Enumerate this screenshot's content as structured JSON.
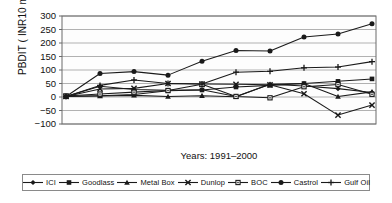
{
  "chart_data": {
    "type": "line",
    "title": "",
    "xlabel": "Years: 1991–2000",
    "ylabel": "PBDIT ( INR10 million)",
    "x": [
      1991,
      1992,
      1993,
      1994,
      1995,
      1996,
      1997,
      1998,
      1999,
      2000
    ],
    "categories": [
      "1991",
      "1992",
      "1993",
      "1994",
      "1995",
      "1996",
      "1997",
      "1998",
      "1999",
      "2000"
    ],
    "ylim": [
      -100,
      300
    ],
    "yticks": [
      -100,
      -50,
      0,
      50,
      100,
      150,
      200,
      250,
      300
    ],
    "ytick_labels": [
      "−100",
      "−50",
      "0",
      "50",
      "100",
      "150",
      "200",
      "250",
      "300"
    ],
    "grid": true,
    "grid_axis": "y",
    "legend_position": "bottom",
    "series": [
      {
        "name": "ICI",
        "marker": "diamond",
        "color": "#1a1a1a",
        "values": [
          2,
          40,
          28,
          25,
          27,
          2,
          47,
          41,
          31,
          17
        ]
      },
      {
        "name": "Goodlass",
        "marker": "square",
        "color": "#1a1a1a",
        "values": [
          3,
          5,
          9,
          23,
          26,
          37,
          43,
          50,
          58,
          67
        ]
      },
      {
        "name": "Metal Box",
        "marker": "triangle",
        "color": "#1a1a1a",
        "values": [
          2,
          4,
          6,
          2,
          5,
          1,
          47,
          50,
          2,
          19
        ]
      },
      {
        "name": "Dunlop",
        "marker": "x",
        "color": "#1a1a1a",
        "values": [
          2,
          30,
          32,
          50,
          48,
          47,
          45,
          12,
          -67,
          -30
        ]
      },
      {
        "name": "BOC",
        "marker": "small-square",
        "color": "#1a1a1a",
        "values": [
          4,
          11,
          18,
          24,
          47,
          2,
          -3,
          38,
          46,
          10
        ]
      },
      {
        "name": "Castrol",
        "marker": "circle",
        "color": "#1a1a1a",
        "values": [
          2,
          87,
          94,
          81,
          132,
          172,
          170,
          222,
          233,
          271
        ]
      },
      {
        "name": "Gulf Oil",
        "marker": "plus",
        "color": "#1a1a1a",
        "values": [
          2,
          43,
          63,
          50,
          48,
          92,
          95,
          108,
          111,
          131
        ]
      }
    ]
  },
  "legend": {
    "items": [
      {
        "label": "ICI",
        "marker": "diamond"
      },
      {
        "label": "Goodlass",
        "marker": "square"
      },
      {
        "label": "Metal Box",
        "marker": "triangle"
      },
      {
        "label": "Dunlop",
        "marker": "x"
      },
      {
        "label": "BOC",
        "marker": "small-square"
      },
      {
        "label": "Castrol",
        "marker": "circle"
      },
      {
        "label": "Gulf Oil",
        "marker": "plus"
      }
    ]
  },
  "axes": {
    "y_axis_title": "PBDIT ( INR10 million)",
    "x_axis_title": "Years: 1991–2000"
  },
  "colors": {
    "plot_border": "#6b6b6b",
    "gridline": "#8f8f8f",
    "series_ink": "#1a1a1a",
    "background": "#ffffff",
    "legend_border": "#8a8a8a"
  }
}
